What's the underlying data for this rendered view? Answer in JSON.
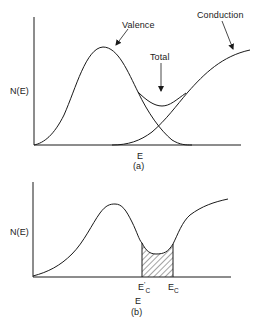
{
  "figure": {
    "panel_a": {
      "caption": "(a)",
      "y_label": "N(E)",
      "x_label": "E",
      "curve_labels": {
        "valence": "Valence",
        "total": "Total",
        "conduction": "Conduction"
      }
    },
    "panel_b": {
      "caption": "(b)",
      "y_label": "N(E)",
      "x_label": "E",
      "markers": {
        "ec_prime_main": "E",
        "ec_prime_sub": "C",
        "ec_prime_mark": "'",
        "ec_main": "E",
        "ec_sub": "C"
      },
      "shaded_region": "between E'C and EC"
    },
    "colors": {
      "line": "#1a1a1a",
      "background": "#ffffff"
    }
  }
}
